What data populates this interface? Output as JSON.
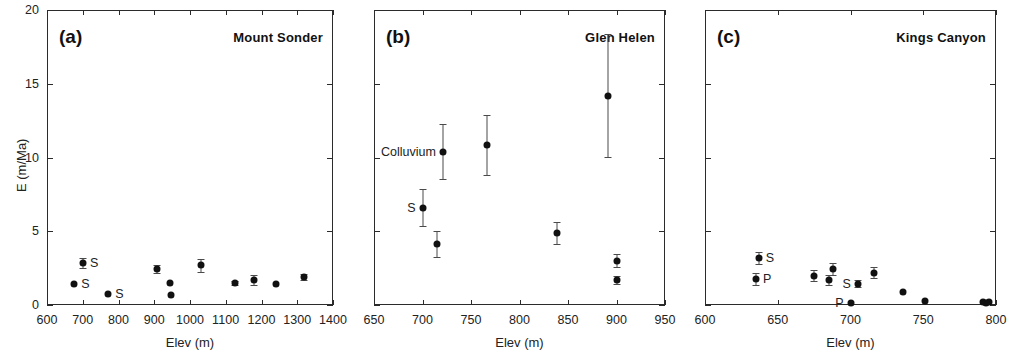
{
  "figure": {
    "axis_title_x": "Elev (m)",
    "axis_title_y": "E (m/Ma)"
  },
  "chart_data": [
    {
      "type": "scatter",
      "panel": "(a)",
      "title": "Mount Sonder",
      "xlabel": "Elev (m)",
      "ylabel": "E (m/Ma)",
      "xlim": [
        600,
        1400
      ],
      "ylim": [
        0,
        20
      ],
      "xticks": [
        600,
        700,
        800,
        900,
        1000,
        1100,
        1200,
        1300,
        1400
      ],
      "yticks": [
        0,
        5,
        10,
        15,
        20
      ],
      "grid": false,
      "legend": null,
      "points": [
        {
          "x": 676,
          "y": 1.45,
          "yerr": 0.0,
          "label": "S",
          "label_side": "right"
        },
        {
          "x": 701,
          "y": 2.85,
          "yerr": 0.35,
          "label": "S",
          "label_side": "right"
        },
        {
          "x": 771,
          "y": 0.75,
          "yerr": 0.0,
          "label": "S",
          "label_side": "right"
        },
        {
          "x": 909,
          "y": 2.45,
          "yerr": 0.28,
          "label": null,
          "label_side": "right"
        },
        {
          "x": 945,
          "y": 1.5,
          "yerr": 0.0,
          "label": null,
          "label_side": "right"
        },
        {
          "x": 946,
          "y": 0.65,
          "yerr": 0.0,
          "label": null,
          "label_side": "right"
        },
        {
          "x": 1030,
          "y": 2.7,
          "yerr": 0.45,
          "label": null,
          "label_side": "right"
        },
        {
          "x": 1126,
          "y": 1.5,
          "yerr": 0.15,
          "label": null,
          "label_side": "right"
        },
        {
          "x": 1180,
          "y": 1.7,
          "yerr": 0.35,
          "label": null,
          "label_side": "right"
        },
        {
          "x": 1240,
          "y": 1.45,
          "yerr": 0.0,
          "label": null,
          "label_side": "right"
        },
        {
          "x": 1320,
          "y": 1.9,
          "yerr": 0.18,
          "label": null,
          "label_side": "right"
        }
      ]
    },
    {
      "type": "scatter",
      "panel": "(b)",
      "title": "Glen Helen",
      "xlabel": "Elev (m)",
      "ylabel": "E (m/Ma)",
      "xlim": [
        650,
        950
      ],
      "ylim": [
        0,
        20
      ],
      "xticks": [
        650,
        700,
        750,
        800,
        850,
        900,
        950
      ],
      "yticks": [
        0,
        5,
        10,
        15,
        20
      ],
      "grid": false,
      "legend": null,
      "points": [
        {
          "x": 700,
          "y": 6.6,
          "yerr": 1.25,
          "label": "S",
          "label_side": "left"
        },
        {
          "x": 715,
          "y": 4.15,
          "yerr": 0.9,
          "label": null,
          "label_side": "left"
        },
        {
          "x": 721,
          "y": 10.4,
          "yerr": 1.85,
          "label": "Colluvium",
          "label_side": "left"
        },
        {
          "x": 766,
          "y": 10.85,
          "yerr": 2.05,
          "label": null,
          "label_side": "left"
        },
        {
          "x": 839,
          "y": 4.9,
          "yerr": 0.75,
          "label": null,
          "label_side": "left"
        },
        {
          "x": 891,
          "y": 14.2,
          "yerr": 4.15,
          "label": null,
          "label_side": "left"
        },
        {
          "x": 901,
          "y": 3.0,
          "yerr": 0.45,
          "label": null,
          "label_side": "left"
        },
        {
          "x": 901,
          "y": 1.7,
          "yerr": 0.3,
          "label": null,
          "label_side": "left"
        }
      ]
    },
    {
      "type": "scatter",
      "panel": "(c)",
      "title": "Kings Canyon",
      "xlabel": "Elev (m)",
      "ylabel": "E (m/Ma)",
      "xlim": [
        600,
        800
      ],
      "ylim": [
        0,
        20
      ],
      "xticks": [
        600,
        650,
        700,
        750,
        800
      ],
      "yticks": [
        0,
        5,
        10,
        15,
        20
      ],
      "grid": false,
      "legend": null,
      "points": [
        {
          "x": 637,
          "y": 3.2,
          "yerr": 0.4,
          "label": "S",
          "label_side": "right"
        },
        {
          "x": 635,
          "y": 1.75,
          "yerr": 0.4,
          "label": "P",
          "label_side": "right"
        },
        {
          "x": 675,
          "y": 2.0,
          "yerr": 0.35,
          "label": null,
          "label_side": "right"
        },
        {
          "x": 685,
          "y": 1.7,
          "yerr": 0.35,
          "label": null,
          "label_side": "right"
        },
        {
          "x": 688,
          "y": 2.45,
          "yerr": 0.4,
          "label": null,
          "label_side": "right"
        },
        {
          "x": 705,
          "y": 1.45,
          "yerr": 0.25,
          "label": "S",
          "label_side": "left"
        },
        {
          "x": 700,
          "y": 0.12,
          "yerr": 0.0,
          "label": "P",
          "label_side": "left"
        },
        {
          "x": 716,
          "y": 2.2,
          "yerr": 0.35,
          "label": null,
          "label_side": "right"
        },
        {
          "x": 736,
          "y": 0.85,
          "yerr": 0.0,
          "label": null,
          "label_side": "right"
        },
        {
          "x": 751,
          "y": 0.3,
          "yerr": 0.0,
          "label": null,
          "label_side": "right"
        },
        {
          "x": 791,
          "y": 0.18,
          "yerr": 0.0,
          "label": null,
          "label_side": "right"
        },
        {
          "x": 793,
          "y": 0.12,
          "yerr": 0.0,
          "label": null,
          "label_side": "right"
        },
        {
          "x": 795,
          "y": 0.2,
          "yerr": 0.0,
          "label": null,
          "label_side": "right"
        }
      ]
    }
  ],
  "panel_geometry": [
    {
      "left": 47,
      "right": 333,
      "top": 10,
      "bottom": 305,
      "show_y_axis": true
    },
    {
      "left": 374,
      "right": 665,
      "top": 10,
      "bottom": 305,
      "show_y_axis": false
    },
    {
      "left": 705,
      "right": 996,
      "top": 10,
      "bottom": 305,
      "show_y_axis": false
    }
  ]
}
